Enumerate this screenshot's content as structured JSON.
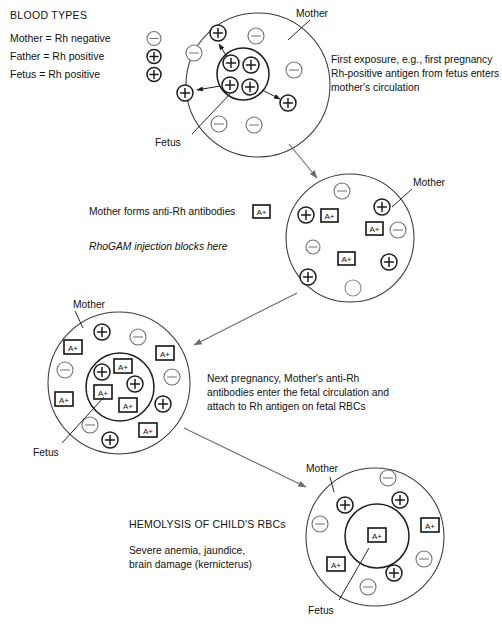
{
  "title": "BLOOD TYPES",
  "legend": [
    {
      "label": "Mother = Rh negative",
      "symbol": "minus"
    },
    {
      "label": "Father = Rh positive",
      "symbol": "plus"
    },
    {
      "label": "Fetus = Rh positive",
      "symbol": "plus"
    }
  ],
  "symbols": {
    "plus": "+",
    "minus": "−",
    "antibody": "A+"
  },
  "stages": [
    {
      "id": "stage-1",
      "mother_label": "Mother",
      "fetus_label": "Fetus",
      "caption": [
        "First exposure, e.g., first pregnancy",
        "Rh-positive antigen from fetus enters",
        "mother's circulation"
      ]
    },
    {
      "id": "stage-2",
      "mother_label": "Mother",
      "fetus_label": "",
      "caption": [
        "Mother forms anti-Rh antibodies"
      ],
      "caption_italic": "RhoGAM injection blocks here",
      "caption_badge": "A+"
    },
    {
      "id": "stage-3",
      "mother_label": "Mother",
      "fetus_label": "Fetus",
      "caption": [
        "Next pregnancy, Mother's anti-Rh",
        "antibodies enter the fetal circulation and",
        "attach to Rh antigen on fetal RBCs"
      ]
    },
    {
      "id": "stage-4",
      "mother_label": "Mother",
      "fetus_label": "Fetus",
      "heading": "HEMOLYSIS OF CHILD'S RBCs",
      "caption": [
        "Severe anemia, jaundice,",
        "brain damage (kernicterus)"
      ]
    }
  ],
  "colors": {
    "ink": "#111111",
    "outline": "#3a3a3a",
    "faint": "#707070",
    "arrow": "#6b6b6b",
    "background": "#ffffff"
  }
}
